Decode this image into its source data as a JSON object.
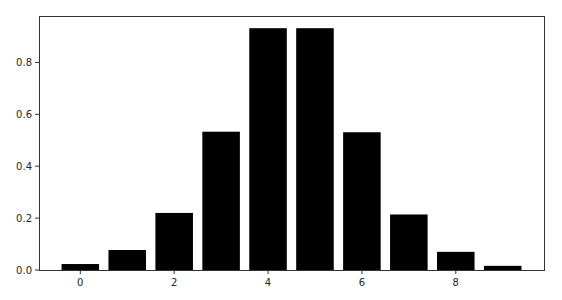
{
  "chart_data": {
    "type": "bar",
    "title": "",
    "xlabel": "",
    "ylabel": "",
    "categories": [
      0,
      1,
      2,
      3,
      4,
      5,
      6,
      7,
      8,
      9
    ],
    "values": [
      0.023,
      0.077,
      0.22,
      0.533,
      0.932,
      0.932,
      0.531,
      0.214,
      0.07,
      0.016
    ],
    "bar_color": "#000000",
    "bar_width": 0.8,
    "xlim": [
      -0.88,
      9.88
    ],
    "ylim": [
      0.0,
      0.979
    ],
    "xticks": [
      0,
      2,
      4,
      6,
      8
    ],
    "xtick_labels": [
      "0",
      "2",
      "4",
      "6",
      "8"
    ],
    "yticks": [
      0.0,
      0.2,
      0.4,
      0.6,
      0.8
    ],
    "ytick_labels": [
      "0.0",
      "0.2",
      "0.4",
      "0.6",
      "0.8"
    ],
    "grid": false,
    "legend": null
  },
  "plot_area": {
    "left": 39,
    "top": 16,
    "right": 544,
    "bottom": 270
  },
  "colors": {
    "axis": "#333333",
    "text": "#262626",
    "bar": "#000000",
    "background": "#ffffff"
  }
}
